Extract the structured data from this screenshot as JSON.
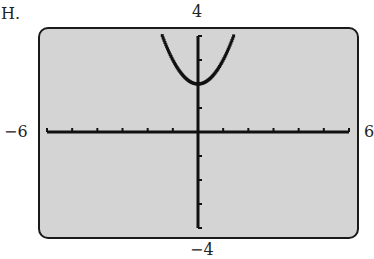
{
  "panel_label": "H.",
  "window": {
    "xmin_label": "−6",
    "xmax_label": "6",
    "ymin_label": "−4",
    "ymax_label": "4"
  },
  "colors": {
    "screen_bg": "#d4d4d4",
    "frame": "#1a1a1a",
    "axes": "#111111",
    "curve": "#111111"
  },
  "chart_data": {
    "type": "line",
    "title": "",
    "xlabel": "",
    "ylabel": "",
    "xlim": [
      -6,
      6
    ],
    "ylim": [
      -4,
      4
    ],
    "x_ticks_step": 1,
    "y_ticks_step": 1,
    "grid": false,
    "legend": null,
    "series": [
      {
        "name": "y = x^2 + 2",
        "x": [
          -1.4,
          -1.2,
          -1.0,
          -0.8,
          -0.6,
          -0.4,
          -0.2,
          0.0,
          0.2,
          0.4,
          0.6,
          0.8,
          1.0,
          1.2,
          1.4
        ],
        "y": [
          3.96,
          3.44,
          3.0,
          2.64,
          2.36,
          2.16,
          2.04,
          2.0,
          2.04,
          2.16,
          2.36,
          2.64,
          3.0,
          3.44,
          3.96
        ]
      }
    ],
    "annotations": [
      "−6",
      "6",
      "−4",
      "4"
    ]
  }
}
